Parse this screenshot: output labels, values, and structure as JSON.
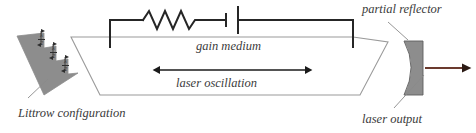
{
  "figure": {
    "type": "optical-schematic",
    "title_visible": false,
    "background": "#ffffff"
  },
  "labels": {
    "gain_medium": "gain medium",
    "laser_oscillation": "laser oscillation",
    "littrow": "Littrow configuration",
    "partial_reflector": "partial reflector",
    "laser_output": "laser output"
  },
  "step_annotations": [
    {
      "numerator": "λ",
      "denominator": "2"
    },
    {
      "numerator": "λ",
      "denominator": "2"
    },
    {
      "numerator": "λ",
      "denominator": "2"
    }
  ],
  "components": {
    "grating": {
      "name": "echelle staircase grating",
      "fill": "#8d8d8d",
      "steps": 3
    },
    "cavity": {
      "name": "laser cavity trapezoid",
      "stroke": "#9a9a9a"
    },
    "pump_circuit": {
      "name": "resistor and battery pump circuit",
      "stroke": "#262626",
      "elements": [
        "resistor",
        "battery"
      ]
    },
    "partial_reflector": {
      "name": "concave partial reflector",
      "fill": "#8d8d8d",
      "stroke": "#5a5a5a"
    },
    "oscillation_arrow": {
      "name": "double headed arrow",
      "color": "#1a1a1a",
      "heads": 2
    },
    "output_arrow": {
      "name": "laser output arrow",
      "color": "#6b3a2e",
      "heads": 1
    }
  },
  "colors": {
    "gray_fill": "#8d8d8d",
    "cavity_line": "#9a9a9a",
    "circuit_line": "#262626",
    "text": "#3b3b3b",
    "output_arrow": "#6b3a2e"
  }
}
